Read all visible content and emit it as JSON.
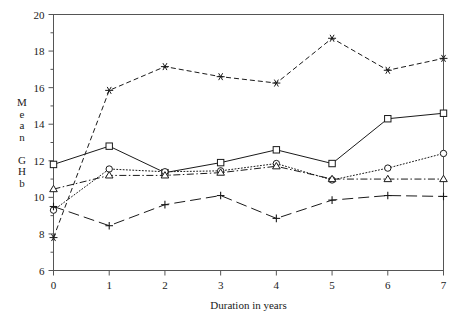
{
  "chart_data": {
    "type": "line",
    "title": "",
    "xlabel": "Duration in years",
    "ylabel": "Mean GHb",
    "ylabel_chars": [
      "M",
      "e",
      "a",
      "n",
      "",
      "G",
      "H",
      "b"
    ],
    "x": [
      0,
      1,
      2,
      3,
      4,
      5,
      6,
      7
    ],
    "xlim": [
      0,
      7
    ],
    "ylim": [
      6,
      20
    ],
    "xticks": [
      0,
      1,
      2,
      3,
      4,
      5,
      6,
      7
    ],
    "xtick_labels": [
      "0",
      "1",
      "2",
      "3",
      "4",
      "5",
      "6",
      "7"
    ],
    "yticks": [
      6,
      8,
      10,
      12,
      14,
      16,
      18,
      20
    ],
    "ytick_labels": [
      "6",
      "8",
      "10",
      "12",
      "14",
      "16",
      "18",
      "20"
    ],
    "yticks_minor": [
      7,
      9,
      11,
      13,
      15,
      17,
      19
    ],
    "grid": false,
    "legend": "none",
    "frame": "box",
    "series": [
      {
        "name": "series-1",
        "linestyle": "dashed",
        "marker": "star",
        "color": "#1a1a1a",
        "values": [
          7.8,
          15.85,
          17.15,
          16.6,
          16.25,
          18.7,
          16.95,
          17.6
        ]
      },
      {
        "name": "series-2",
        "linestyle": "solid",
        "marker": "square",
        "color": "#1a1a1a",
        "values": [
          11.8,
          12.8,
          11.35,
          11.9,
          12.6,
          11.85,
          14.3,
          14.6
        ]
      },
      {
        "name": "series-3",
        "linestyle": "dotted",
        "marker": "circle",
        "color": "#1a1a1a",
        "values": [
          9.3,
          11.55,
          11.4,
          11.45,
          11.85,
          10.95,
          11.6,
          12.4
        ]
      },
      {
        "name": "series-4",
        "linestyle": "dashdot",
        "marker": "triangle",
        "color": "#1a1a1a",
        "values": [
          10.45,
          11.2,
          11.2,
          11.35,
          11.7,
          11.0,
          11.0,
          11.0
        ]
      },
      {
        "name": "series-5",
        "linestyle": "longdash",
        "marker": "plus",
        "color": "#1a1a1a",
        "values": [
          9.5,
          8.45,
          9.6,
          10.1,
          8.85,
          9.85,
          10.1,
          10.05
        ]
      }
    ]
  }
}
